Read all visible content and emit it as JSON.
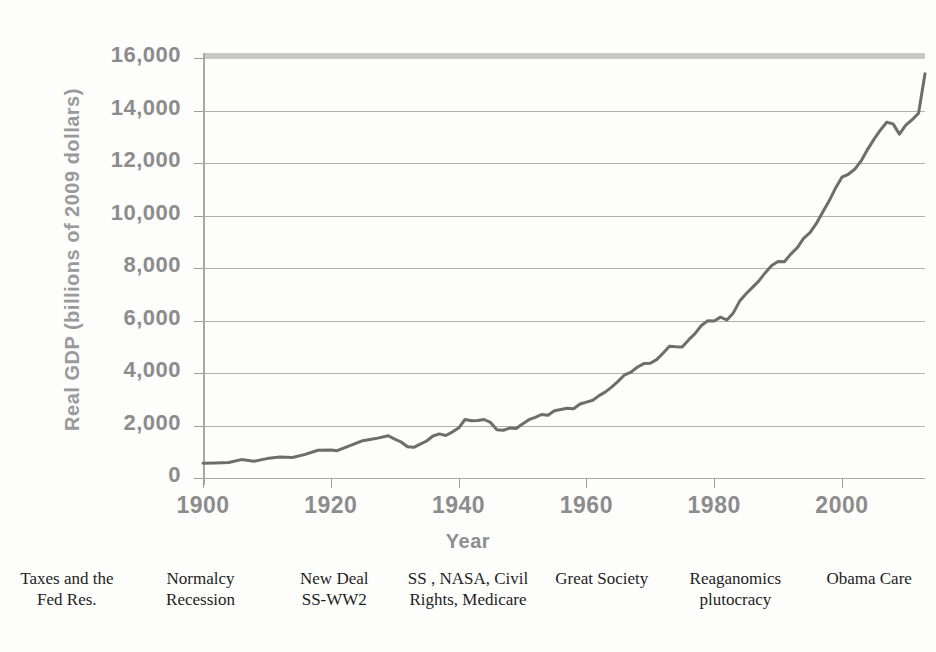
{
  "chart_data": {
    "type": "line",
    "title": "",
    "xlabel": "Year",
    "ylabel": "Real GDP (billions of 2009 dollars)",
    "xlim": [
      1900,
      2013
    ],
    "ylim": [
      0,
      16000
    ],
    "xticks": [
      1900,
      1920,
      1940,
      1960,
      1980,
      2000
    ],
    "xticklabels": [
      "1900",
      "1920",
      "1940",
      "1960",
      "1980",
      "2000"
    ],
    "yticks": [
      0,
      2000,
      4000,
      6000,
      8000,
      10000,
      12000,
      14000,
      16000
    ],
    "yticklabels": [
      "0",
      "2,000",
      "4,000",
      "6,000",
      "8,000",
      "10,000",
      "12,000",
      "14,000",
      "16,000"
    ],
    "grid": true,
    "legend": "none",
    "line_color": "#6d6d6d",
    "grid_color": "#b2b2b2",
    "series": [
      {
        "name": "Real GDP",
        "x": [
          1900,
          1901,
          1902,
          1903,
          1904,
          1905,
          1906,
          1907,
          1908,
          1909,
          1910,
          1911,
          1912,
          1913,
          1914,
          1915,
          1916,
          1917,
          1918,
          1919,
          1920,
          1921,
          1922,
          1923,
          1924,
          1925,
          1926,
          1927,
          1928,
          1929,
          1930,
          1931,
          1932,
          1933,
          1934,
          1935,
          1936,
          1937,
          1938,
          1939,
          1940,
          1941,
          1942,
          1943,
          1944,
          1945,
          1946,
          1947,
          1948,
          1949,
          1950,
          1951,
          1952,
          1953,
          1954,
          1955,
          1956,
          1957,
          1958,
          1959,
          1960,
          1961,
          1962,
          1963,
          1964,
          1965,
          1966,
          1967,
          1968,
          1969,
          1970,
          1971,
          1972,
          1973,
          1974,
          1975,
          1976,
          1977,
          1978,
          1979,
          1980,
          1981,
          1982,
          1983,
          1984,
          1985,
          1986,
          1987,
          1988,
          1989,
          1990,
          1991,
          1992,
          1993,
          1994,
          1995,
          1996,
          1997,
          1998,
          1999,
          2000,
          2001,
          2002,
          2003,
          2004,
          2005,
          2006,
          2007,
          2008,
          2009,
          2010,
          2011,
          2012,
          2013
        ],
        "values": [
          550,
          560,
          575,
          600,
          595,
          640,
          700,
          715,
          660,
          735,
          755,
          775,
          820,
          845,
          780,
          800,
          905,
          985,
          1075,
          1090,
          1080,
          1055,
          1115,
          1260,
          1300,
          1455,
          1550,
          1565,
          1580,
          1685,
          1540,
          1435,
          1250,
          1230,
          1365,
          1490,
          1680,
          1770,
          1700,
          1840,
          1990,
          2330,
          2770,
          3230,
          3480,
          3440,
          3060,
          3020,
          3150,
          3130,
          3410,
          3680,
          3830,
          4010,
          3960,
          4240,
          4330,
          4410,
          4380,
          4680,
          4800,
          4925,
          5220,
          5450,
          5760,
          6130,
          6530,
          6700,
          7020,
          7240,
          7250,
          7490,
          7890,
          8340,
          8300,
          8280,
          8730,
          9130,
          9640,
          9950,
          9930,
          10180,
          9990,
          10440,
          11190,
          11650,
          12050,
          12470,
          12980,
          13450,
          13700,
          13680,
          14160,
          14550,
          15150,
          15510,
          16100,
          16820,
          17520,
          18330,
          19020,
          19200,
          19510,
          20050,
          20770,
          21400,
          21990,
          22500,
          22380,
          21750,
          22300,
          22650,
          23050,
          23400
        ],
        "values_scaled_note": "plotted_series_below",
        "plot_points": [
          [
            1900,
            560
          ],
          [
            1902,
            575
          ],
          [
            1904,
            590
          ],
          [
            1906,
            700
          ],
          [
            1908,
            640
          ],
          [
            1910,
            740
          ],
          [
            1912,
            800
          ],
          [
            1914,
            780
          ],
          [
            1916,
            900
          ],
          [
            1918,
            1060
          ],
          [
            1920,
            1070
          ],
          [
            1921,
            1040
          ],
          [
            1923,
            1230
          ],
          [
            1925,
            1420
          ],
          [
            1927,
            1500
          ],
          [
            1929,
            1610
          ],
          [
            1930,
            1480
          ],
          [
            1931,
            1370
          ],
          [
            1932,
            1190
          ],
          [
            1933,
            1170
          ],
          [
            1934,
            1290
          ],
          [
            1935,
            1410
          ],
          [
            1936,
            1600
          ],
          [
            1937,
            1680
          ],
          [
            1938,
            1620
          ],
          [
            1939,
            1750
          ],
          [
            1940,
            1900
          ],
          [
            1941,
            2230
          ],
          [
            1942,
            2180
          ],
          [
            1943,
            2190
          ],
          [
            1944,
            2230
          ],
          [
            1945,
            2120
          ],
          [
            1946,
            1840
          ],
          [
            1947,
            1820
          ],
          [
            1948,
            1900
          ],
          [
            1949,
            1890
          ],
          [
            1950,
            2060
          ],
          [
            1951,
            2220
          ],
          [
            1952,
            2310
          ],
          [
            1953,
            2420
          ],
          [
            1954,
            2390
          ],
          [
            1955,
            2560
          ],
          [
            1956,
            2610
          ],
          [
            1957,
            2660
          ],
          [
            1958,
            2640
          ],
          [
            1959,
            2820
          ],
          [
            1960,
            2890
          ],
          [
            1961,
            2960
          ],
          [
            1962,
            3140
          ],
          [
            1963,
            3280
          ],
          [
            1964,
            3470
          ],
          [
            1965,
            3690
          ],
          [
            1966,
            3930
          ],
          [
            1967,
            4030
          ],
          [
            1968,
            4230
          ],
          [
            1969,
            4360
          ],
          [
            1970,
            4370
          ],
          [
            1971,
            4510
          ],
          [
            1972,
            4750
          ],
          [
            1973,
            5020
          ],
          [
            1974,
            5000
          ],
          [
            1975,
            4990
          ],
          [
            1976,
            5260
          ],
          [
            1977,
            5500
          ],
          [
            1978,
            5810
          ],
          [
            1979,
            5990
          ],
          [
            1980,
            5980
          ],
          [
            1981,
            6130
          ],
          [
            1982,
            6020
          ],
          [
            1983,
            6290
          ],
          [
            1984,
            6740
          ],
          [
            1985,
            7020
          ],
          [
            1986,
            7260
          ],
          [
            1987,
            7510
          ],
          [
            1988,
            7820
          ],
          [
            1989,
            8100
          ],
          [
            1990,
            8250
          ],
          [
            1991,
            8240
          ],
          [
            1992,
            8530
          ],
          [
            1993,
            8770
          ],
          [
            1994,
            9130
          ],
          [
            1995,
            9350
          ],
          [
            1996,
            9700
          ],
          [
            1997,
            10130
          ],
          [
            1998,
            10560
          ],
          [
            1999,
            11040
          ],
          [
            2000,
            11460
          ],
          [
            2001,
            11570
          ],
          [
            2002,
            11760
          ],
          [
            2003,
            12080
          ],
          [
            2004,
            12510
          ],
          [
            2005,
            12900
          ],
          [
            2006,
            13250
          ],
          [
            2007,
            13550
          ],
          [
            2008,
            13490
          ],
          [
            2009,
            13100
          ],
          [
            2010,
            13440
          ],
          [
            2011,
            13650
          ],
          [
            2012,
            13900
          ],
          [
            2013,
            15400
          ]
        ]
      }
    ],
    "annotations": [
      {
        "lines": [
          "Taxes and the",
          "Fed Res."
        ]
      },
      {
        "lines": [
          "Normalcy",
          "Recession"
        ]
      },
      {
        "lines": [
          "New Deal",
          "SS-WW2"
        ]
      },
      {
        "lines": [
          "SS , NASA, Civil",
          "Rights, Medicare"
        ]
      },
      {
        "lines": [
          "Great Society"
        ]
      },
      {
        "lines": [
          "Reaganomics",
          "plutocracy"
        ]
      },
      {
        "lines": [
          "Obama Care"
        ]
      }
    ]
  }
}
